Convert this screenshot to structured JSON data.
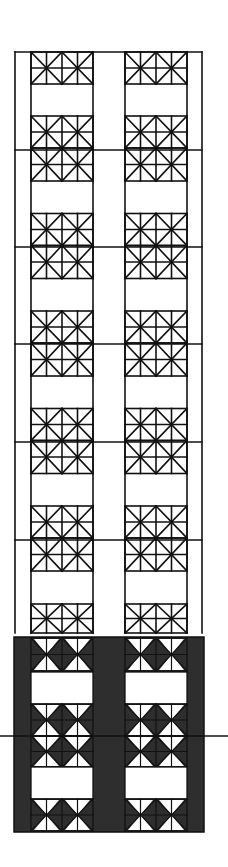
{
  "figure": {
    "title": "",
    "colors": {
      "background": "#ffffff",
      "line": "#111111",
      "dark_fill": "#2e2e2e",
      "light_triangle": "#ffffff"
    }
  },
  "upper_section": {
    "frame": {
      "x": 15,
      "y": 52,
      "width": 187,
      "height": 581
    },
    "columns": [
      {
        "x": 31,
        "width": 62
      },
      {
        "x": 125,
        "width": 62
      }
    ],
    "row_period": 97,
    "first_rule_y": 150,
    "rules_y": [
      150,
      247,
      344,
      442,
      540
    ],
    "tile_rows": [
      52,
      116,
      149,
      213,
      246,
      310,
      343,
      407,
      441,
      505,
      539,
      603
    ]
  },
  "lower_section": {
    "panel": {
      "x": 14,
      "y": 637,
      "width": 190,
      "height": 195
    },
    "columns": [
      {
        "x": 31,
        "width": 62
      },
      {
        "x": 125,
        "width": 62
      }
    ],
    "white_bands": [
      {
        "y": 672,
        "height": 32
      },
      {
        "y": 767,
        "height": 32
      }
    ],
    "section_line_y": 736
  }
}
